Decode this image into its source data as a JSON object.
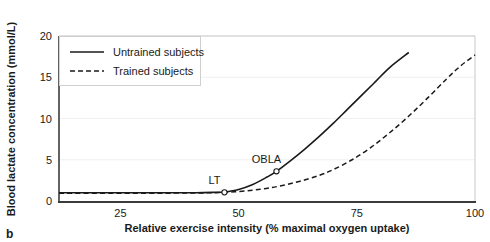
{
  "figure": {
    "panel_label": "b"
  },
  "chart_data": {
    "type": "line",
    "title": "",
    "xlabel": "Relative exercise intensity (% maximal oxygen uptake)",
    "ylabel": "Blood lactate concentration (mmol/L)",
    "xlim": [
      12,
      100
    ],
    "ylim": [
      0,
      20
    ],
    "xticks": [
      25,
      50,
      75,
      100
    ],
    "xtick_labels": [
      "25",
      "50",
      "75",
      "100"
    ],
    "yticks": [
      0,
      5,
      10,
      15,
      20
    ],
    "ytick_labels": [
      "0",
      "5",
      "10",
      "15",
      "20"
    ],
    "grid": true,
    "legend_position": "upper left",
    "series": [
      {
        "name": "Untrained subjects",
        "style": "solid",
        "color": "#1a1a1a",
        "x": [
          12,
          20,
          28,
          35,
          41,
          45,
          47,
          50,
          53,
          56,
          58,
          61,
          64,
          67,
          70,
          73,
          76,
          79,
          82,
          86
        ],
        "y": [
          1.0,
          1.0,
          1.0,
          1.0,
          1.0,
          1.05,
          1.1,
          1.4,
          2.0,
          2.9,
          3.6,
          4.9,
          6.3,
          7.8,
          9.4,
          11.1,
          12.8,
          14.5,
          16.2,
          18.0
        ]
      },
      {
        "name": "Trained subjects",
        "style": "dashed",
        "color": "#1a1a1a",
        "x": [
          12,
          25,
          35,
          44,
          50,
          55,
          59,
          63,
          67,
          70,
          74,
          78,
          82,
          86,
          90,
          94,
          97,
          100
        ],
        "y": [
          0.95,
          0.95,
          0.95,
          1.0,
          1.15,
          1.45,
          1.85,
          2.4,
          3.1,
          3.8,
          5.0,
          6.5,
          8.3,
          10.3,
          12.5,
          14.8,
          16.4,
          17.7
        ]
      }
    ],
    "annotations": [
      {
        "label": "LT",
        "x": 47,
        "y": 1.05,
        "marker": "open-circle",
        "series": "Untrained subjects"
      },
      {
        "label": "OBLA",
        "x": 58,
        "y": 3.6,
        "marker": "open-circle",
        "series": "Untrained subjects"
      }
    ]
  }
}
